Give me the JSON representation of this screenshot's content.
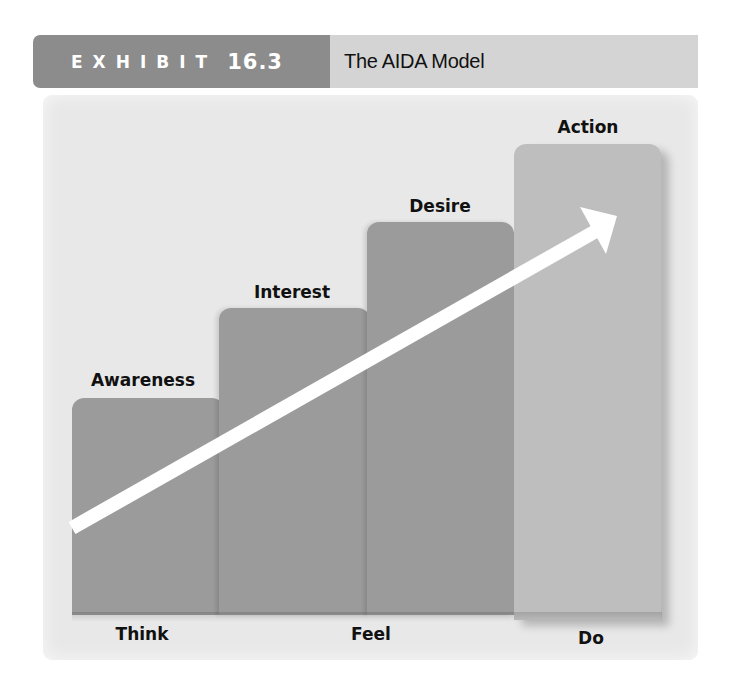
{
  "header": {
    "exhibit_word": "EXHIBIT",
    "exhibit_number": "16.3",
    "title": "The AIDA Model"
  },
  "colors": {
    "header_tag": "#8c8c8c",
    "header_band": "#d4d4d4",
    "panel_bg": "#e8e8e8",
    "bar": "#9b9b9b",
    "action_bar": "#bebebe",
    "arrow": "#ffffff",
    "text": "#111111"
  },
  "stages": [
    {
      "label": "Awareness",
      "order": 1
    },
    {
      "label": "Interest",
      "order": 2
    },
    {
      "label": "Desire",
      "order": 3
    },
    {
      "label": "Action",
      "order": 4
    }
  ],
  "phases": [
    {
      "label": "Think",
      "spans": [
        "Awareness"
      ]
    },
    {
      "label": "Feel",
      "spans": [
        "Interest",
        "Desire"
      ]
    },
    {
      "label": "Do",
      "spans": [
        "Action"
      ]
    }
  ],
  "arrow": {
    "direction": "up-right",
    "meaning": "progression from Awareness to Action"
  }
}
